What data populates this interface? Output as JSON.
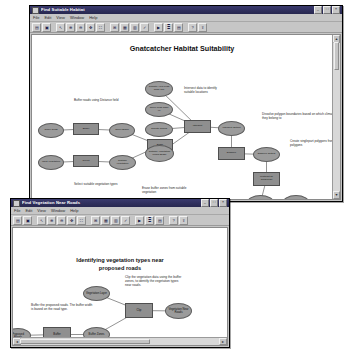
{
  "windows": {
    "back": {
      "title": "Find Suitable Habitat",
      "menus": [
        "File",
        "Edit",
        "View",
        "Window",
        "Help"
      ],
      "toolbar_icons": [
        "save-icon",
        "print-icon",
        "select-icon",
        "zoom-in-icon",
        "zoom-out-icon",
        "pan-icon",
        "full-extent-icon",
        "auto-layout-icon",
        "diagram-properties-icon",
        "add-data-icon",
        "validate-icon",
        "run-icon",
        "model-properties-icon",
        "report-icon",
        "help-icon",
        "export-icon"
      ],
      "diagram_title": "Gnatcatcher Habitat Suitability",
      "nodes": [
        {
          "id": "slope_grids",
          "label": "Slope Grids",
          "shape": "oval",
          "x": 6,
          "y": 88,
          "w": 26,
          "h": 15
        },
        {
          "id": "buffer_tool",
          "label": "Buffer",
          "shape": "rect",
          "x": 41,
          "y": 88,
          "w": 26,
          "h": 12
        },
        {
          "id": "slope_buffer",
          "label": "Slope Buffer",
          "shape": "oval",
          "x": 77,
          "y": 88,
          "w": 26,
          "h": 15
        },
        {
          "id": "input_vegetation",
          "label": "Input Vegetation",
          "shape": "oval",
          "x": 6,
          "y": 120,
          "w": 26,
          "h": 15
        },
        {
          "id": "select_tool",
          "label": "Select",
          "shape": "rect",
          "x": 41,
          "y": 120,
          "w": 26,
          "h": 12
        },
        {
          "id": "suitable_vegetation",
          "label": "Suitable Vegetation",
          "shape": "oval",
          "x": 77,
          "y": 120,
          "w": 27,
          "h": 15
        },
        {
          "id": "erase_tool",
          "label": "Erase",
          "shape": "rect",
          "x": 115,
          "y": 104,
          "w": 26,
          "h": 13
        },
        {
          "id": "climate_less_than_10k",
          "label": "Climate Area Less Than 10k",
          "shape": "oval",
          "x": 113,
          "y": 46,
          "w": 28,
          "h": 16
        },
        {
          "id": "slope_less_than_40",
          "label": "Slope Less Than 40",
          "shape": "oval",
          "x": 113,
          "y": 67,
          "w": 28,
          "h": 15
        },
        {
          "id": "climate_zones",
          "label": "Climate Zones",
          "shape": "oval",
          "x": 113,
          "y": 87,
          "w": 28,
          "h": 15
        },
        {
          "id": "suitable_vegetation_erase",
          "label": "Suitable Vegetation Minus Erase",
          "shape": "oval",
          "x": 113,
          "y": 110,
          "w": 29,
          "h": 17
        },
        {
          "id": "intersect_tool",
          "label": "Intersect",
          "shape": "rect",
          "x": 152,
          "y": 85,
          "w": 27,
          "h": 13
        },
        {
          "id": "intersect_output",
          "label": "Intersect Output",
          "shape": "oval",
          "x": 186,
          "y": 86,
          "w": 27,
          "h": 15
        },
        {
          "id": "dissolve_tool",
          "label": "Dissolve",
          "shape": "rect",
          "x": 186,
          "y": 112,
          "w": 27,
          "h": 13
        },
        {
          "id": "dissolve_output",
          "label": "Dissolve Output",
          "shape": "oval",
          "x": 221,
          "y": 112,
          "w": 27,
          "h": 15
        },
        {
          "id": "multipart_tool",
          "label": "Multipart To Singlepart",
          "shape": "rect",
          "x": 221,
          "y": 137,
          "w": 27,
          "h": 14
        },
        {
          "id": "singlepart_output",
          "label": "Singlepart Output",
          "shape": "oval",
          "x": 215,
          "y": 160,
          "w": 27,
          "h": 15
        },
        {
          "id": "select_patches_tool",
          "label": "Select",
          "shape": "rect",
          "x": 215,
          "y": 183,
          "w": 27,
          "h": 13
        },
        {
          "id": "suitable_habitat",
          "label": "Suitable Gnatcatcher Habitat",
          "shape": "oval",
          "x": 250,
          "y": 160,
          "w": 28,
          "h": 17
        }
      ],
      "links": [
        [
          "slope_grids",
          "buffer_tool"
        ],
        [
          "buffer_tool",
          "slope_buffer"
        ],
        [
          "input_vegetation",
          "select_tool"
        ],
        [
          "select_tool",
          "suitable_vegetation"
        ],
        [
          "slope_buffer",
          "erase_tool"
        ],
        [
          "suitable_vegetation",
          "erase_tool"
        ],
        [
          "erase_tool",
          "suitable_vegetation_erase"
        ],
        [
          "climate_less_than_10k",
          "intersect_tool"
        ],
        [
          "slope_less_than_40",
          "intersect_tool"
        ],
        [
          "climate_zones",
          "intersect_tool"
        ],
        [
          "suitable_vegetation_erase",
          "intersect_tool"
        ],
        [
          "intersect_tool",
          "intersect_output"
        ],
        [
          "intersect_output",
          "dissolve_tool"
        ],
        [
          "dissolve_tool",
          "dissolve_output"
        ],
        [
          "dissolve_output",
          "multipart_tool"
        ],
        [
          "multipart_tool",
          "singlepart_output"
        ],
        [
          "singlepart_output",
          "select_patches_tool"
        ],
        [
          "select_patches_tool",
          "suitable_habitat"
        ]
      ],
      "notes": [
        {
          "id": "note-buffer",
          "text": "Buffer roads using Distance field",
          "x": 42,
          "y": 64,
          "w": 58
        },
        {
          "id": "note-select-veg",
          "text": "Select suitable vegetation types",
          "x": 42,
          "y": 148,
          "w": 55
        },
        {
          "id": "note-erase",
          "text": "Erase buffer zones from suitable vegetation",
          "x": 110,
          "y": 152,
          "w": 54
        },
        {
          "id": "note-intersect",
          "text": "Intersect data to identify suitable locations",
          "x": 152,
          "y": 52,
          "w": 44
        },
        {
          "id": "note-dissolve",
          "text": "Dissolve polygon boundaries based on which climate zone they belong to",
          "x": 230,
          "y": 78,
          "w": 82
        },
        {
          "id": "note-multipart",
          "text": "Create singlepart polygons from multipart polygons",
          "x": 258,
          "y": 105,
          "w": 64
        },
        {
          "id": "note-select-patches",
          "text": "Select potential locations: Suitable patches in climate zones 1 & 2 are >= 25 acres",
          "x": 250,
          "y": 172,
          "w": 68
        },
        {
          "id": "note-select-patches2",
          "text": "Suitable patches in climate zone 3 are >=50 acres",
          "x": 250,
          "y": 190,
          "w": 68
        }
      ]
    },
    "front": {
      "title": "Find Vegetation Near Roads",
      "menus": [
        "File",
        "Edit",
        "View",
        "Window",
        "Help"
      ],
      "toolbar_icons": [
        "save-icon",
        "print-icon",
        "select-icon",
        "zoom-in-icon",
        "zoom-out-icon",
        "pan-icon",
        "full-extent-icon",
        "auto-layout-icon",
        "diagram-properties-icon",
        "add-data-icon",
        "validate-icon",
        "run-icon",
        "model-properties-icon",
        "report-icon",
        "help-icon",
        "export-icon"
      ],
      "diagram_title_line1": "Identifying vegetation types near",
      "diagram_title_line2": "proposed roads",
      "nodes": [
        {
          "id": "proposed_roads",
          "label": "Proposed Roads",
          "shape": "oval",
          "x": -8,
          "y": 100,
          "w": 26,
          "h": 15
        },
        {
          "id": "buffer_tool2",
          "label": "Buffer",
          "shape": "rect",
          "x": 30,
          "y": 99,
          "w": 28,
          "h": 15
        },
        {
          "id": "buffer_zones",
          "label": "Buffer Zones",
          "shape": "oval",
          "x": 70,
          "y": 99,
          "w": 27,
          "h": 15
        },
        {
          "id": "vegetation_layer",
          "label": "Vegetation Layer",
          "shape": "oval",
          "x": 70,
          "y": 58,
          "w": 27,
          "h": 15
        },
        {
          "id": "clip_tool",
          "label": "Clip",
          "shape": "rect",
          "x": 112,
          "y": 75,
          "w": 28,
          "h": 15
        },
        {
          "id": "veg_near_roads",
          "label": "Vegetation Near Roads",
          "shape": "oval",
          "x": 152,
          "y": 75,
          "w": 27,
          "h": 16
        }
      ],
      "links": [
        [
          "proposed_roads",
          "buffer_tool2"
        ],
        [
          "buffer_tool2",
          "buffer_zones"
        ],
        [
          "buffer_zones",
          "clip_tool"
        ],
        [
          "vegetation_layer",
          "clip_tool"
        ],
        [
          "clip_tool",
          "veg_near_roads"
        ]
      ],
      "notes": [
        {
          "id": "note-buffer-roads",
          "text": "Buffer the proposed roads. The buffer width is based on the road type.",
          "x": 18,
          "y": 76,
          "w": 62
        },
        {
          "id": "note-clip",
          "text": "Clip the vegetation data using the buffer zones, to identify the vegetation types near roads.",
          "x": 112,
          "y": 48,
          "w": 58
        }
      ]
    }
  },
  "colors": {
    "titlebar": "#2e2e5c",
    "window_face": "#c6c6c6",
    "canvas": "#ffffff",
    "node_oval": "#9b9b9b",
    "node_rect": "#8f8f8f",
    "link": "#4a4a4a"
  }
}
